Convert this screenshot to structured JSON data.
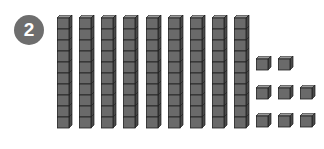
{
  "problem": {
    "number_label": "2",
    "badge_color": "#6e6e6e"
  },
  "blocks": {
    "cube_front_color": "#6a6a6a",
    "cube_top_color": "#9a9a9a",
    "cube_side_color": "#4a4a4a",
    "edge_color": "#1e1e1e",
    "tens_rods": {
      "count": 9,
      "cubes_per_rod": 10,
      "x_positions": [
        57,
        79,
        101,
        123,
        146,
        168,
        190,
        212,
        234
      ]
    },
    "ones_units": {
      "count": 8,
      "positions": [
        {
          "x": 256,
          "y": 56
        },
        {
          "x": 278,
          "y": 56
        },
        {
          "x": 256,
          "y": 85
        },
        {
          "x": 278,
          "y": 85
        },
        {
          "x": 300,
          "y": 85
        },
        {
          "x": 256,
          "y": 113
        },
        {
          "x": 278,
          "y": 113
        },
        {
          "x": 300,
          "y": 113
        }
      ]
    }
  }
}
